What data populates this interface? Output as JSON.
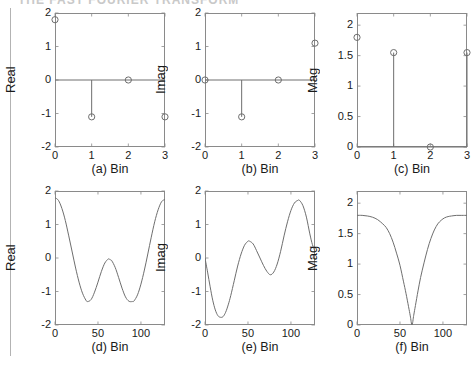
{
  "figure": {
    "background": "#ffffff",
    "axis_color": "#8a8a8a",
    "line_color": "#6e6e6e",
    "text_color": "#1a1a1a",
    "top_cut_text": "THE FAST FOURIER TRANSFORM"
  },
  "chart_data": [
    {
      "id": "a",
      "type": "scatter",
      "title": "",
      "caption": "(a) Bin",
      "xlabel": "Bin",
      "ylabel": "Real",
      "x": [
        0,
        1,
        2,
        3
      ],
      "values": [
        1.8,
        -1.1,
        0,
        -1.1
      ],
      "stems": [
        false,
        true,
        false,
        false
      ],
      "baseline": 0,
      "xlim": [
        0,
        3
      ],
      "ylim": [
        -2,
        2
      ],
      "xticks": [
        0,
        1,
        2,
        3
      ],
      "xticklabels": [
        "0",
        "1",
        "2",
        "3"
      ],
      "yticks": [
        -2,
        -1,
        0,
        1,
        2
      ],
      "yticklabels": [
        "-2",
        "-1",
        "0",
        "1",
        "2"
      ],
      "grid": false,
      "marker": "open-circle"
    },
    {
      "id": "b",
      "type": "scatter",
      "title": "",
      "caption": "(b) Bin",
      "xlabel": "Bin",
      "ylabel": "Imag",
      "x": [
        0,
        1,
        2,
        3
      ],
      "values": [
        0,
        -1.1,
        0,
        1.1
      ],
      "stems": [
        false,
        true,
        false,
        false
      ],
      "baseline": 0,
      "xlim": [
        0,
        3
      ],
      "ylim": [
        -2,
        2
      ],
      "xticks": [
        0,
        1,
        2,
        3
      ],
      "xticklabels": [
        "0",
        "1",
        "2",
        "3"
      ],
      "yticks": [
        -2,
        -1,
        0,
        1,
        2
      ],
      "yticklabels": [
        "-2",
        "-1",
        "0",
        "1",
        "2"
      ],
      "grid": false,
      "marker": "open-circle"
    },
    {
      "id": "c",
      "type": "scatter",
      "title": "",
      "caption": "(c) Bin",
      "xlabel": "Bin",
      "ylabel": "Mag",
      "x": [
        0,
        1,
        2,
        3
      ],
      "values": [
        1.8,
        1.55,
        0.0,
        1.55
      ],
      "stems": [
        false,
        true,
        false,
        true
      ],
      "baseline": 0,
      "xlim": [
        0,
        3
      ],
      "ylim": [
        0,
        2.2
      ],
      "xticks": [
        0,
        1,
        2,
        3
      ],
      "xticklabels": [
        "0",
        "1",
        "2",
        "3"
      ],
      "yticks": [
        0,
        0.5,
        1,
        1.5,
        2
      ],
      "yticklabels": [
        "0",
        "0.5",
        "1",
        "1.5",
        "2"
      ],
      "grid": false,
      "marker": "open-circle"
    },
    {
      "id": "d",
      "type": "line",
      "title": "",
      "caption": "(d) Bin",
      "xlabel": "Bin",
      "ylabel": "Real",
      "xlim": [
        0,
        128
      ],
      "ylim": [
        -2,
        2
      ],
      "xticks": [
        0,
        50,
        100
      ],
      "xticklabels": [
        "0",
        "50",
        "100"
      ],
      "yticks": [
        -2,
        -1,
        0,
        1,
        2
      ],
      "yticklabels": [
        "-2",
        "-1",
        "0",
        "1",
        "2"
      ],
      "grid": false,
      "x": [
        0,
        4,
        8,
        12,
        16,
        20,
        24,
        28,
        32,
        36,
        38,
        42,
        46,
        50,
        54,
        58,
        62,
        64,
        66,
        70,
        74,
        78,
        82,
        86,
        90,
        92,
        96,
        100,
        104,
        108,
        112,
        116,
        120,
        124,
        128
      ],
      "values": [
        1.8,
        1.72,
        1.48,
        1.12,
        0.66,
        0.18,
        -0.3,
        -0.72,
        -1.05,
        -1.26,
        -1.3,
        -1.24,
        -1.02,
        -0.72,
        -0.4,
        -0.15,
        -0.03,
        -0.05,
        -0.08,
        -0.28,
        -0.58,
        -0.9,
        -1.16,
        -1.29,
        -1.3,
        -1.28,
        -1.1,
        -0.78,
        -0.36,
        0.12,
        0.62,
        1.08,
        1.44,
        1.68,
        1.75
      ]
    },
    {
      "id": "e",
      "type": "line",
      "title": "",
      "caption": "(e) Bin",
      "xlabel": "Bin",
      "ylabel": "Imag",
      "xlim": [
        0,
        128
      ],
      "ylim": [
        -2,
        2
      ],
      "xticks": [
        0,
        50,
        100
      ],
      "xticklabels": [
        "0",
        "50",
        "100"
      ],
      "yticks": [
        -2,
        -1,
        0,
        1,
        2
      ],
      "yticklabels": [
        "-2",
        "-1",
        "0",
        "1",
        "2"
      ],
      "grid": false,
      "x": [
        0,
        3,
        6,
        9,
        12,
        15,
        18,
        21,
        24,
        27,
        30,
        34,
        38,
        42,
        46,
        50,
        52,
        56,
        60,
        64,
        68,
        72,
        76,
        80,
        84,
        88,
        92,
        96,
        100,
        104,
        108,
        110,
        114,
        118,
        122,
        125,
        128
      ],
      "values": [
        0.0,
        -0.42,
        -0.86,
        -1.26,
        -1.55,
        -1.72,
        -1.77,
        -1.75,
        -1.62,
        -1.4,
        -1.12,
        -0.68,
        -0.24,
        0.12,
        0.38,
        0.5,
        0.5,
        0.42,
        0.22,
        0.0,
        -0.22,
        -0.4,
        -0.5,
        -0.42,
        -0.18,
        0.2,
        0.66,
        1.08,
        1.42,
        1.64,
        1.72,
        1.72,
        1.56,
        1.22,
        0.72,
        0.4,
        0.2
      ]
    },
    {
      "id": "f",
      "type": "line",
      "title": "",
      "caption": "(f) Bin",
      "xlabel": "Bin",
      "ylabel": "Mag",
      "xlim": [
        0,
        128
      ],
      "ylim": [
        0,
        2.2
      ],
      "xticks": [
        0,
        50,
        100
      ],
      "xticklabels": [
        "0",
        "50",
        "100"
      ],
      "yticks": [
        0,
        0.5,
        1,
        1.5,
        2
      ],
      "yticklabels": [
        "0",
        "0.5",
        "1",
        "1.5",
        "2"
      ],
      "grid": false,
      "x": [
        0,
        6,
        12,
        18,
        24,
        30,
        34,
        38,
        42,
        46,
        50,
        54,
        57,
        60,
        62,
        64,
        66,
        68,
        71,
        74,
        78,
        82,
        86,
        90,
        94,
        98,
        102,
        106,
        110,
        116,
        122,
        128
      ],
      "values": [
        1.8,
        1.8,
        1.79,
        1.77,
        1.73,
        1.66,
        1.6,
        1.5,
        1.36,
        1.18,
        0.98,
        0.72,
        0.52,
        0.3,
        0.15,
        0.0,
        0.16,
        0.32,
        0.56,
        0.78,
        1.02,
        1.24,
        1.42,
        1.56,
        1.66,
        1.72,
        1.76,
        1.78,
        1.79,
        1.8,
        1.8,
        1.8
      ]
    }
  ]
}
